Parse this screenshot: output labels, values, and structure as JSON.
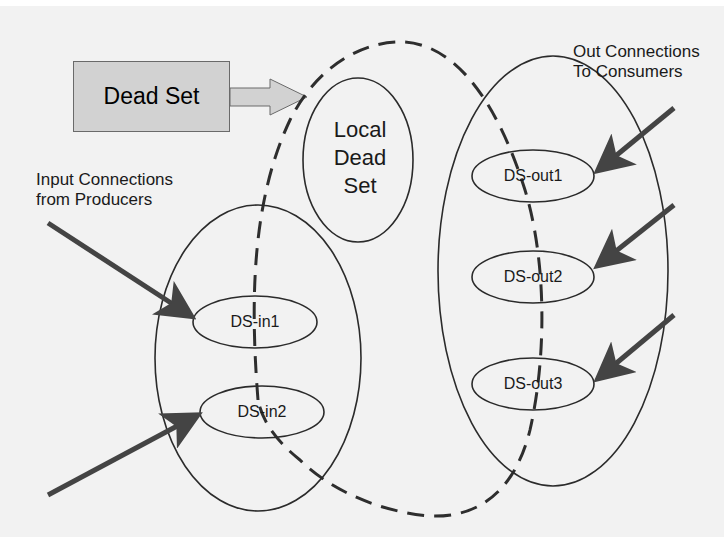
{
  "diagram": {
    "colors": {
      "background": "#f2f2f2",
      "stroke": "#2b2b2b",
      "arrow": "#444444",
      "dead_set_fill": "#d2d2d2"
    },
    "dead_set": {
      "label": "Dead Set"
    },
    "local_dead_set": {
      "line1": "Local",
      "line2": "Dead",
      "line3": "Set"
    },
    "input_annotation": {
      "line1": "Input Connections",
      "line2": "from Producers"
    },
    "output_annotation": {
      "line1": "Out Connections",
      "line2": "To Consumers"
    },
    "input_nodes": [
      {
        "label": "DS-in1"
      },
      {
        "label": "DS-in2"
      }
    ],
    "output_nodes": [
      {
        "label": "DS-out1"
      },
      {
        "label": "DS-out2"
      },
      {
        "label": "DS-out3"
      }
    ]
  }
}
